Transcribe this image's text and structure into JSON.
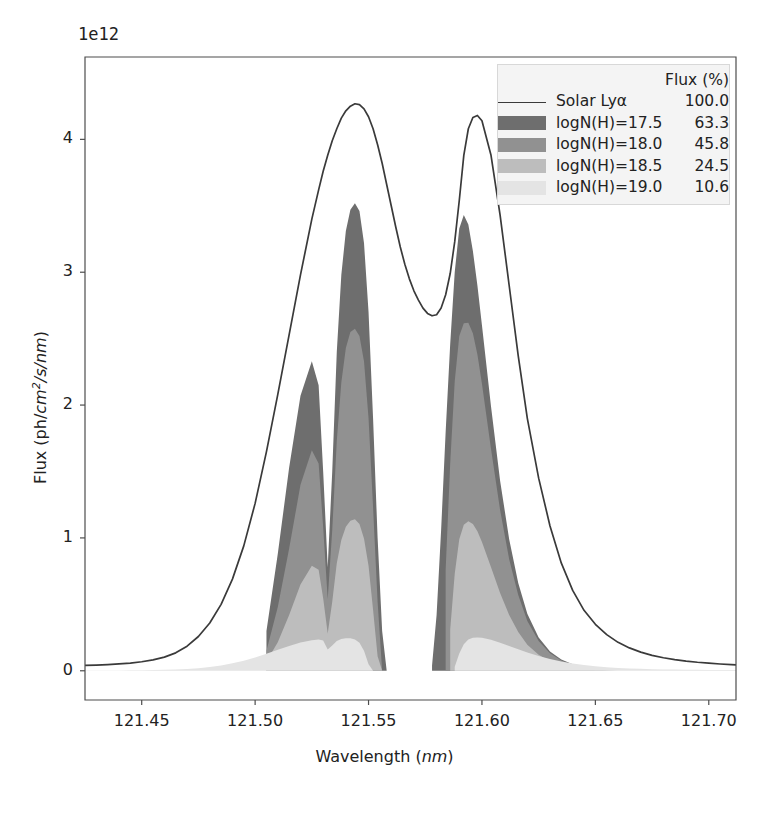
{
  "figure": {
    "offset_label": "1e12",
    "axis_color": "#4d4d4d",
    "line_color": "#3a3a3a",
    "legend_facecolor": "#f4f4f4",
    "legend_edgecolor": "#d8d8d8"
  },
  "legend": {
    "header": "Flux (%)",
    "entries": [
      {
        "label": "Solar Lyα",
        "value": "100.0",
        "key": "line",
        "color": "#3a3a3a"
      },
      {
        "label": "logN(H)=17.5",
        "value": "63.3",
        "key": "swatch",
        "color": "#6e6e6e"
      },
      {
        "label": "logN(H)=18.0",
        "value": "45.8",
        "key": "swatch",
        "color": "#919191"
      },
      {
        "label": "logN(H)=18.5",
        "value": "24.5",
        "key": "swatch",
        "color": "#bdbdbd"
      },
      {
        "label": "logN(H)=19.0",
        "value": "10.6",
        "key": "swatch",
        "color": "#e4e4e4"
      }
    ]
  },
  "chart_data": {
    "type": "area",
    "title": "",
    "xlabel": "Wavelength (nm)",
    "ylabel": "Flux (ph/cm2/s/nm)",
    "ylabel_parts": {
      "pre": "Flux (ph/",
      "italic1": "cm",
      "sup": "2",
      "italic2": "/s/nm",
      "post": ")"
    },
    "xlabel_parts": {
      "pre": "Wavelength (",
      "italic": "nm",
      "post": ")"
    },
    "y_offset_exponent": "1e12",
    "grid": false,
    "legend_position": "upper right",
    "xlim": [
      121.425,
      121.712
    ],
    "ylim": [
      -0.22,
      4.62
    ],
    "xticks": [
      "121.45",
      "121.50",
      "121.55",
      "121.60",
      "121.65",
      "121.70"
    ],
    "xtick_values": [
      121.45,
      121.5,
      121.55,
      121.6,
      121.65,
      121.7
    ],
    "yticks": [
      "0",
      "1",
      "2",
      "3",
      "4"
    ],
    "ytick_values": [
      0,
      1,
      2,
      3,
      4
    ],
    "x": [
      121.425,
      121.43,
      121.435,
      121.44,
      121.445,
      121.45,
      121.455,
      121.46,
      121.465,
      121.47,
      121.475,
      121.48,
      121.485,
      121.49,
      121.495,
      121.5,
      121.505,
      121.51,
      121.515,
      121.52,
      121.525,
      121.528,
      121.53,
      121.532,
      121.534,
      121.536,
      121.538,
      121.54,
      121.542,
      121.544,
      121.546,
      121.548,
      121.55,
      121.552,
      121.554,
      121.556,
      121.558,
      121.56,
      121.562,
      121.564,
      121.566,
      121.568,
      121.57,
      121.572,
      121.574,
      121.576,
      121.578,
      121.58,
      121.582,
      121.584,
      121.586,
      121.588,
      121.59,
      121.592,
      121.594,
      121.596,
      121.598,
      121.6,
      121.604,
      121.608,
      121.612,
      121.616,
      121.62,
      121.625,
      121.63,
      121.635,
      121.64,
      121.645,
      121.65,
      121.655,
      121.66,
      121.665,
      121.67,
      121.675,
      121.68,
      121.685,
      121.69,
      121.695,
      121.7,
      121.705,
      121.71,
      121.712
    ],
    "series": [
      {
        "name": "Solar Lyα",
        "flux_percent": 100.0,
        "style": "line",
        "color": "#3a3a3a",
        "peaks": [
          {
            "wavelength": 121.5435,
            "value": 4.27
          },
          {
            "wavelength": 121.5925,
            "value": 4.18
          }
        ],
        "central_dip": {
          "wavelength": 121.5685,
          "value": 2.67
        },
        "values": [
          0.04,
          0.043,
          0.047,
          0.052,
          0.058,
          0.068,
          0.082,
          0.103,
          0.135,
          0.185,
          0.258,
          0.36,
          0.5,
          0.69,
          0.94,
          1.26,
          1.65,
          2.08,
          2.53,
          2.98,
          3.4,
          3.62,
          3.76,
          3.88,
          3.99,
          4.08,
          4.16,
          4.215,
          4.25,
          4.268,
          4.262,
          4.23,
          4.17,
          4.08,
          3.96,
          3.82,
          3.66,
          3.5,
          3.34,
          3.19,
          3.06,
          2.95,
          2.86,
          2.79,
          2.73,
          2.69,
          2.672,
          2.68,
          2.73,
          2.83,
          2.99,
          3.23,
          3.54,
          3.88,
          4.08,
          4.165,
          4.18,
          4.14,
          3.88,
          3.43,
          2.9,
          2.37,
          1.9,
          1.45,
          1.09,
          0.81,
          0.605,
          0.455,
          0.35,
          0.272,
          0.214,
          0.172,
          0.14,
          0.116,
          0.098,
          0.084,
          0.073,
          0.064,
          0.057,
          0.051,
          0.046,
          0.044
        ]
      },
      {
        "name": "logN(H)=17.5",
        "flux_percent": 63.3,
        "style": "fill",
        "color": "#6e6e6e",
        "peaks": [
          {
            "wavelength": 121.5425,
            "value": 3.52
          },
          {
            "wavelength": 121.593,
            "value": 3.43
          }
        ],
        "absorption_core": [
          121.5565,
          121.5785
        ],
        "fill_start": 121.5,
        "fill_end": 121.65,
        "values": [
          0,
          0,
          0,
          0,
          0,
          0,
          0,
          0,
          0,
          0,
          0,
          0,
          0,
          0,
          0,
          0.0,
          0.3,
          0.88,
          1.53,
          2.07,
          2.33,
          2.15,
          1.5,
          0.78,
          1.5,
          2.4,
          2.98,
          3.31,
          3.47,
          3.52,
          3.46,
          3.22,
          2.7,
          1.9,
          1.0,
          0.3,
          0.0,
          0.0,
          0.0,
          0.0,
          0.0,
          0.0,
          0.0,
          0.0,
          0.0,
          0.0,
          0.04,
          0.42,
          1.06,
          1.8,
          2.46,
          3.0,
          3.33,
          3.43,
          3.36,
          3.16,
          2.9,
          2.6,
          1.99,
          1.43,
          0.99,
          0.66,
          0.43,
          0.25,
          0.145,
          0.085,
          0.05,
          0.03,
          0.0,
          0,
          0,
          0,
          0,
          0,
          0,
          0,
          0,
          0,
          0,
          0,
          0,
          0
        ]
      },
      {
        "name": "logN(H)=18.0",
        "flux_percent": 45.8,
        "style": "fill",
        "color": "#919191",
        "peaks": [
          {
            "wavelength": 121.5415,
            "value": 2.58
          },
          {
            "wavelength": 121.5945,
            "value": 2.62
          }
        ],
        "absorption_core": [
          121.552,
          121.583
        ],
        "fill_start": 121.5,
        "fill_end": 121.66,
        "values": [
          0,
          0,
          0,
          0,
          0,
          0,
          0,
          0,
          0,
          0,
          0,
          0,
          0,
          0,
          0,
          0.0,
          0.15,
          0.48,
          0.92,
          1.4,
          1.66,
          1.56,
          1.08,
          0.54,
          1.06,
          1.73,
          2.17,
          2.43,
          2.55,
          2.575,
          2.52,
          2.33,
          1.9,
          1.23,
          0.52,
          0.0,
          0.0,
          0.0,
          0.0,
          0.0,
          0.0,
          0.0,
          0.0,
          0.0,
          0.0,
          0.0,
          0.0,
          0.0,
          0.0,
          0.76,
          1.56,
          2.18,
          2.52,
          2.615,
          2.62,
          2.54,
          2.38,
          2.16,
          1.67,
          1.21,
          0.84,
          0.57,
          0.375,
          0.225,
          0.132,
          0.078,
          0.046,
          0.028,
          0.017,
          0.0,
          0,
          0,
          0,
          0,
          0,
          0,
          0,
          0,
          0,
          0,
          0,
          0
        ]
      },
      {
        "name": "logN(H)=18.5",
        "flux_percent": 24.5,
        "style": "fill",
        "color": "#bdbdbd",
        "peaks": [
          {
            "wavelength": 121.54,
            "value": 1.14
          },
          {
            "wavelength": 121.5975,
            "value": 1.12
          }
        ],
        "absorption_core": [
          121.547,
          121.5875
        ],
        "fill_start": 121.5,
        "fill_end": 121.665,
        "values": [
          0,
          0,
          0,
          0,
          0,
          0,
          0,
          0,
          0,
          0,
          0,
          0,
          0,
          0,
          0,
          0.0,
          0.07,
          0.215,
          0.42,
          0.65,
          0.79,
          0.76,
          0.545,
          0.28,
          0.52,
          0.81,
          0.985,
          1.085,
          1.13,
          1.14,
          1.105,
          0.995,
          0.79,
          0.46,
          0.11,
          0.0,
          0.0,
          0.0,
          0.0,
          0.0,
          0.0,
          0.0,
          0.0,
          0.0,
          0.0,
          0.0,
          0.0,
          0.0,
          0.0,
          0.0,
          0.31,
          0.73,
          0.99,
          1.1,
          1.125,
          1.105,
          1.05,
          0.97,
          0.78,
          0.585,
          0.42,
          0.292,
          0.196,
          0.12,
          0.072,
          0.043,
          0.026,
          0.016,
          0.01,
          0.006,
          0.0,
          0,
          0,
          0,
          0,
          0,
          0,
          0,
          0,
          0,
          0,
          0
        ]
      },
      {
        "name": "logN(H)=19.0",
        "flux_percent": 10.6,
        "style": "fill",
        "color": "#e4e4e4",
        "peaks": [
          {
            "wavelength": 121.5385,
            "value": 0.245
          },
          {
            "wavelength": 121.601,
            "value": 0.25
          }
        ],
        "absorption_core": [
          121.543,
          121.593
        ],
        "fill_start": 121.425,
        "fill_end": 121.712,
        "values": [
          0.002,
          0.0022,
          0.0025,
          0.0029,
          0.0034,
          0.0042,
          0.0053,
          0.007,
          0.0096,
          0.0136,
          0.0196,
          0.0282,
          0.0402,
          0.056,
          0.076,
          0.1,
          0.128,
          0.158,
          0.187,
          0.212,
          0.23,
          0.236,
          0.228,
          0.16,
          0.19,
          0.225,
          0.24,
          0.245,
          0.244,
          0.235,
          0.21,
          0.15,
          0.05,
          0.0,
          0.0,
          0.0,
          0.0,
          0.0,
          0.0,
          0.0,
          0.0,
          0.0,
          0.0,
          0.0,
          0.0,
          0.0,
          0.0,
          0.0,
          0.0,
          0.0,
          0.0,
          0.03,
          0.13,
          0.2,
          0.235,
          0.249,
          0.25,
          0.248,
          0.233,
          0.211,
          0.187,
          0.162,
          0.138,
          0.111,
          0.089,
          0.07,
          0.055,
          0.043,
          0.034,
          0.027,
          0.0216,
          0.0176,
          0.0146,
          0.0122,
          0.0104,
          0.009,
          0.0079,
          0.007,
          0.0063,
          0.0057,
          0.0052,
          0.005
        ]
      }
    ]
  }
}
